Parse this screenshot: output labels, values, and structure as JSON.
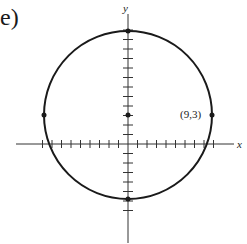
{
  "panel_label": "e)",
  "axes": {
    "x_label": "x",
    "y_label": "y",
    "x_tick_range": [
      -9,
      9
    ],
    "y_tick_range": [
      -7,
      12
    ]
  },
  "circle": {
    "center": [
      0,
      3
    ],
    "radius": 9,
    "marked_points": [
      [
        0,
        3
      ],
      [
        9,
        3
      ],
      [
        -9,
        3
      ],
      [
        0,
        12
      ],
      [
        0,
        -6
      ]
    ]
  },
  "annotations": {
    "point_label": "(9,3)"
  },
  "colors": {
    "stroke": "#1a1a1a",
    "background": "#ffffff"
  }
}
